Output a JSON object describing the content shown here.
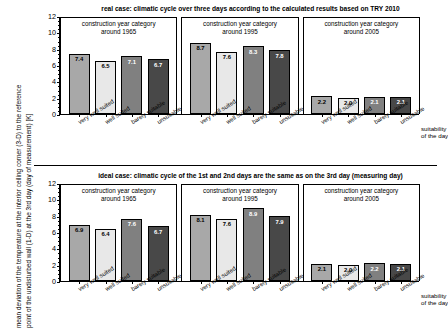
{
  "figure": {
    "y_axis_label_line1": "mean deviation of the temperature at the interior ceiling corner (3-D) to the reference",
    "y_axis_label_line2": "point of the undisturbed wall (1-D) at the 3rd day (day of measurement) [K]",
    "x_axis_caption_line1": "suitability",
    "x_axis_caption_line2": "of the day",
    "colors": {
      "series_very_well_suited": "#a8a8a8",
      "series_well_suited": "#e8e8e8",
      "series_barely_suitable": "#808080",
      "series_unsuitable": "#484848",
      "axis": "#000000",
      "background": "#ffffff"
    }
  },
  "chart_data": [
    {
      "type": "bar",
      "title": "real case: climatic cycle over three days according to the calculated results based on TRY 2010",
      "xlabel": "suitability of the day",
      "ylabel": "mean deviation of the temperature at the interior ceiling corner (3-D) to the reference point of the undisturbed wall (1-D) at the 3rd day (day of measurement) [K]",
      "ylim": [
        0,
        12
      ],
      "yticks": [
        0,
        2,
        4,
        6,
        8,
        10,
        12
      ],
      "grid": false,
      "legend": "none",
      "categories": [
        "very well suited",
        "well suited",
        "barely suitable",
        "unsuitable"
      ],
      "groups": [
        {
          "label_line1": "construction year category",
          "label_line2": "around 1965",
          "values": [
            7.4,
            6.5,
            7.1,
            6.7
          ]
        },
        {
          "label_line1": "construction year category",
          "label_line2": "around 1995",
          "values": [
            8.7,
            7.6,
            8.3,
            7.8
          ]
        },
        {
          "label_line1": "construction year category",
          "label_line2": "around 2005",
          "values": [
            2.2,
            2.0,
            2.1,
            2.1
          ]
        }
      ]
    },
    {
      "type": "bar",
      "title": "ideal case: climatic cycle of the 1st and 2nd days are the same as on the 3rd day (measuring day)",
      "xlabel": "suitability of the day",
      "ylabel": "mean deviation of the temperature at the interior ceiling corner (3-D) to the reference point of the undisturbed wall (1-D) at the 3rd day (day of measurement) [K]",
      "ylim": [
        0,
        12
      ],
      "yticks": [
        0,
        2,
        4,
        6,
        8,
        10,
        12
      ],
      "grid": false,
      "legend": "none",
      "categories": [
        "very well suited",
        "well suited",
        "barely suitable",
        "unsuitable"
      ],
      "groups": [
        {
          "label_line1": "construction year category",
          "label_line2": "around 1965",
          "values": [
            6.9,
            6.4,
            7.6,
            6.7
          ]
        },
        {
          "label_line1": "construction year category",
          "label_line2": "around 1995",
          "values": [
            8.1,
            7.6,
            8.9,
            7.9
          ]
        },
        {
          "label_line1": "construction year category",
          "label_line2": "around 2005",
          "values": [
            2.1,
            2.0,
            2.2,
            2.1
          ]
        }
      ]
    }
  ]
}
